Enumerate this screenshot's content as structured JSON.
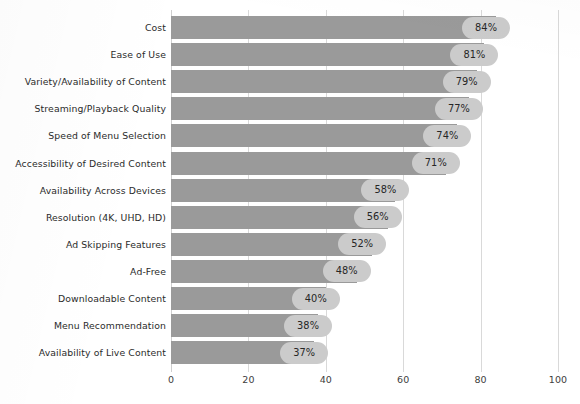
{
  "chart_data": {
    "type": "bar",
    "orientation": "horizontal",
    "title": "",
    "subtitle": "",
    "xlabel": "",
    "ylabel": "",
    "xlim": [
      0,
      100
    ],
    "xticks": [
      "0",
      "20",
      "40",
      "60",
      "80",
      "100"
    ],
    "xtick_values": [
      0,
      20,
      40,
      60,
      80,
      100
    ],
    "grid": true,
    "grid_axis": "x",
    "legend": false,
    "legend_position": "none",
    "value_suffix": "%",
    "categories": [
      "Cost",
      "Ease of Use",
      "Variety/Availability of Content",
      "Streaming/Playback Quality",
      "Speed of Menu Selection",
      "Accessibility of Desired Content",
      "Availability Across Devices",
      "Resolution (4K, UHD, HD)",
      "Ad Skipping Features",
      "Ad-Free",
      "Downloadable Content",
      "Menu Recommendation",
      "Availability of Live Content"
    ],
    "values": [
      84,
      81,
      79,
      77,
      74,
      71,
      58,
      56,
      52,
      48,
      40,
      38,
      37
    ],
    "value_labels": [
      "84%",
      "81%",
      "79%",
      "77%",
      "74%",
      "71%",
      "58%",
      "56%",
      "52%",
      "48%",
      "40%",
      "38%",
      "37%"
    ],
    "colors": {
      "bar": "#9a9a9a",
      "value_pill": "#cbcbcb",
      "grid": "#d9d9d9",
      "text": "#2b2b2b",
      "tick_text": "#3d3d3d",
      "background": "#ffffff"
    }
  }
}
